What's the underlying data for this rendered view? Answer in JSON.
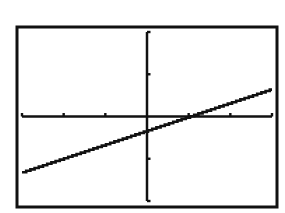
{
  "chart_data": {
    "type": "line",
    "title": "",
    "xlabel": "",
    "ylabel": "",
    "xlim": [
      -3,
      3
    ],
    "ylim": [
      -2,
      2
    ],
    "xscl": 1,
    "yscl": 1,
    "grid": false,
    "legend": null,
    "series": [
      {
        "name": "y = (x - 1)/3",
        "x": [
          -3,
          -2,
          -1,
          0,
          1,
          2,
          3
        ],
        "y": [
          -1.33,
          -1.0,
          -0.67,
          -0.33,
          0.0,
          0.33,
          0.67
        ]
      }
    ],
    "x_intercept": 1,
    "y_intercept": -0.33
  },
  "style": {
    "foreground": "#111111",
    "background": "#ffffff"
  },
  "layout": {
    "frame": {
      "left": 17,
      "top": 27,
      "right": 277,
      "bottom": 207
    },
    "plot": {
      "left": 22,
      "right": 272,
      "top": 32,
      "bottom": 201
    },
    "origin": {
      "x": 146,
      "y": 115
    }
  }
}
